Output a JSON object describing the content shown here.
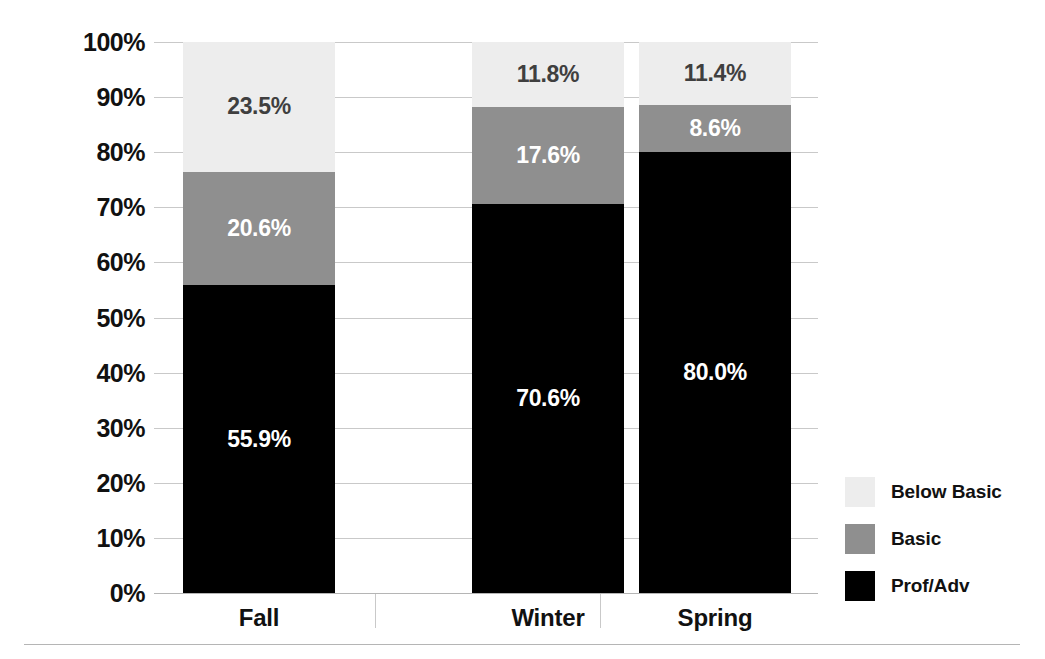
{
  "chart_data": {
    "type": "bar",
    "subtype": "stacked-bar-100",
    "title": "",
    "xlabel": "",
    "ylabel": "Percentage of Students",
    "ylim": [
      0,
      100
    ],
    "yticks": [
      "0%",
      "10%",
      "20%",
      "30%",
      "40%",
      "50%",
      "60%",
      "70%",
      "80%",
      "90%",
      "100%"
    ],
    "ytick_values": [
      0,
      10,
      20,
      30,
      40,
      50,
      60,
      70,
      80,
      90,
      100
    ],
    "grid": true,
    "legend_position": "right",
    "categories": [
      "Fall",
      "Winter",
      "Spring"
    ],
    "series": [
      {
        "name": "Prof/Adv",
        "color": "#000000",
        "values": [
          55.9,
          70.6,
          80.0
        ],
        "labels": [
          "55.9%",
          "70.6%",
          "80.0%"
        ]
      },
      {
        "name": "Basic",
        "color": "#8f8f8f",
        "values": [
          20.6,
          17.6,
          8.6
        ],
        "labels": [
          "20.6%",
          "17.6%",
          "8.6%"
        ]
      },
      {
        "name": "Below Basic",
        "color": "#ededed",
        "values": [
          23.5,
          11.8,
          11.4
        ],
        "labels": [
          "23.5%",
          "11.8%",
          "11.4%"
        ]
      }
    ],
    "legend_entries": [
      "Below Basic",
      "Basic",
      "Prof/Adv"
    ]
  }
}
